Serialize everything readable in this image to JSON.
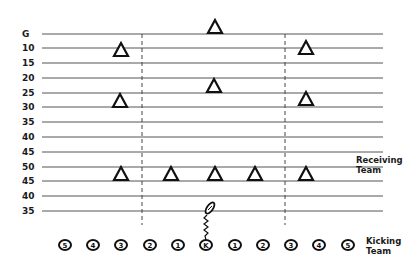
{
  "diagram": {
    "yard_lines": [
      {
        "label": "G",
        "y": 34
      },
      {
        "label": "10",
        "y": 48
      },
      {
        "label": "15",
        "y": 63
      },
      {
        "label": "20",
        "y": 78
      },
      {
        "label": "25",
        "y": 93
      },
      {
        "label": "30",
        "y": 107
      },
      {
        "label": "35",
        "y": 122
      },
      {
        "label": "40",
        "y": 137
      },
      {
        "label": "45",
        "y": 152
      },
      {
        "label": "50",
        "y": 167
      },
      {
        "label": "45",
        "y": 181
      },
      {
        "label": "40",
        "y": 196
      },
      {
        "label": "35",
        "y": 211
      }
    ],
    "hash_marks_x": [
      142,
      285
    ],
    "receiving_team": {
      "label_line1": "Receiving",
      "label_line2": "Team",
      "players": [
        {
          "x": 215,
          "y": 27
        },
        {
          "x": 121,
          "y": 50
        },
        {
          "x": 306,
          "y": 48
        },
        {
          "x": 214,
          "y": 86
        },
        {
          "x": 120,
          "y": 101
        },
        {
          "x": 306,
          "y": 99
        },
        {
          "x": 121,
          "y": 174
        },
        {
          "x": 171,
          "y": 174
        },
        {
          "x": 215,
          "y": 174
        },
        {
          "x": 255,
          "y": 174
        },
        {
          "x": 306,
          "y": 174
        }
      ]
    },
    "kicking_team": {
      "label_line1": "Kicking",
      "label_line2": "Team",
      "players": [
        {
          "label": "5",
          "x": 65
        },
        {
          "label": "4",
          "x": 93
        },
        {
          "label": "3",
          "x": 121
        },
        {
          "label": "2",
          "x": 150
        },
        {
          "label": "1",
          "x": 178
        },
        {
          "label": "K",
          "x": 206
        },
        {
          "label": "1",
          "x": 235
        },
        {
          "label": "2",
          "x": 263
        },
        {
          "label": "3",
          "x": 291
        },
        {
          "label": "4",
          "x": 319
        },
        {
          "label": "5",
          "x": 348
        }
      ],
      "row_y": 245
    },
    "ball": {
      "x": 210,
      "y": 208,
      "icon": "football-icon"
    }
  }
}
